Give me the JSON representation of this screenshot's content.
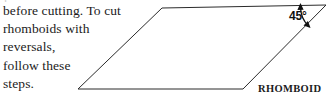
{
  "page": {
    "background_color": "#ffffff",
    "width": 329,
    "height": 104
  },
  "body_text": {
    "lines": [
      "before cutting. To cut",
      "rhomboids with",
      "reversals,",
      "follow these",
      "steps."
    ],
    "full_text": "before cutting. To cut rhomboids with reversals, follow these steps.",
    "color": "#1b1b1b"
  },
  "top_cutoff": {
    "text": "partial line above"
  },
  "figure": {
    "shape_name": "parallelogram",
    "shape_label": "RHOMBOID",
    "angle_label": "45°",
    "angle_value": 45,
    "stroke_color": "#2b2b2b",
    "fill_color": "#ffffff",
    "stroke_width": 1,
    "vertices": {
      "top_left": [
        162,
        8
      ],
      "top_right": [
        326,
        5
      ],
      "bottom_right": [
        243,
        89
      ],
      "bottom_left": [
        78,
        89
      ]
    },
    "angle_arc": {
      "center": [
        326,
        5
      ],
      "radius": 26,
      "arrow_heads": "both",
      "color": "#111111"
    }
  }
}
